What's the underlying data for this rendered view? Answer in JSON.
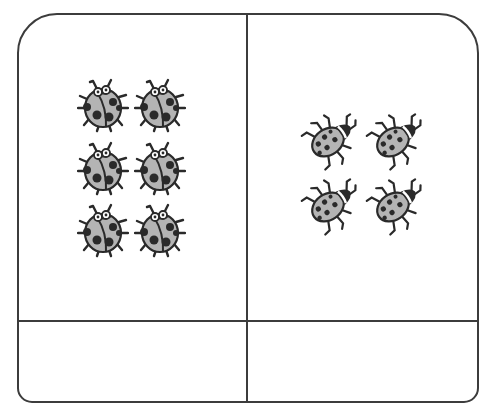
{
  "worksheet": {
    "type": "ladybug-counting-comparison",
    "colors": {
      "border": "#3c3c3c",
      "bug_body": "#b4b4b4",
      "bug_outline": "#2a2a2a",
      "bug_spot": "#2a2a2a"
    },
    "cells": {
      "top_left": {
        "bug_style": "front-facing",
        "count": 6,
        "rows": 3,
        "cols": 2,
        "bugs": [
          {
            "x": 103,
            "y": 105
          },
          {
            "x": 160,
            "y": 105
          },
          {
            "x": 103,
            "y": 168
          },
          {
            "x": 160,
            "y": 168
          },
          {
            "x": 103,
            "y": 230
          },
          {
            "x": 160,
            "y": 230
          }
        ]
      },
      "top_right": {
        "bug_style": "tilted-side-view",
        "count": 4,
        "rows": 2,
        "cols": 2,
        "bugs": [
          {
            "x": 328,
            "y": 142
          },
          {
            "x": 393,
            "y": 142
          },
          {
            "x": 328,
            "y": 207
          },
          {
            "x": 393,
            "y": 207
          }
        ]
      },
      "bottom_left": {
        "answer": ""
      },
      "bottom_right": {
        "answer": ""
      }
    }
  }
}
